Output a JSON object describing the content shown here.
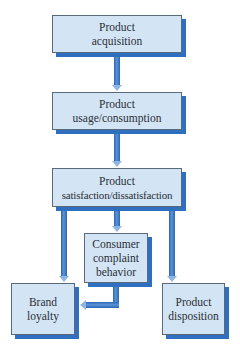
{
  "diagram": {
    "type": "flowchart",
    "colors": {
      "box_fill": "#d3e5f5",
      "box_border": "#5a6a7c",
      "box_shadow": "#2f6fbf",
      "arrow": "#2c66b5",
      "text": "#2a2f36"
    },
    "nodes": [
      {
        "id": "acquisition",
        "lines": [
          "Product",
          "acquisition"
        ]
      },
      {
        "id": "usage",
        "lines": [
          "Product",
          "usage/consumption"
        ]
      },
      {
        "id": "satisfaction",
        "lines": [
          "Product",
          "satisfaction/dissatisfaction"
        ]
      },
      {
        "id": "complaint",
        "lines": [
          "Consumer",
          "complaint",
          "behavior"
        ]
      },
      {
        "id": "loyalty",
        "lines": [
          "Brand",
          "loyalty"
        ]
      },
      {
        "id": "disposition",
        "lines": [
          "Product",
          "disposition"
        ]
      }
    ],
    "edges": [
      {
        "from": "acquisition",
        "to": "usage"
      },
      {
        "from": "usage",
        "to": "satisfaction"
      },
      {
        "from": "satisfaction",
        "to": "complaint"
      },
      {
        "from": "satisfaction",
        "to": "loyalty"
      },
      {
        "from": "satisfaction",
        "to": "disposition"
      },
      {
        "from": "complaint",
        "to": "loyalty"
      }
    ]
  }
}
